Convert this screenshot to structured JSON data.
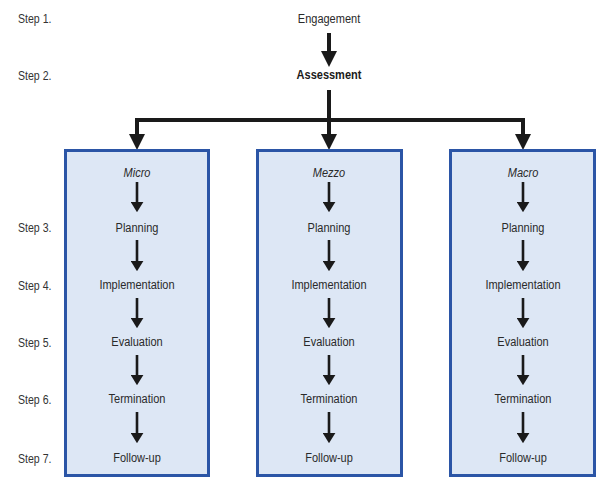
{
  "diagram": {
    "type": "flowchart",
    "colors": {
      "box_fill": "#dde7f5",
      "box_border": "#2b55a6",
      "arrow": "#1a1a1a",
      "text": "#2a2a2a"
    },
    "steps": [
      {
        "label": "Step 1.",
        "y": 20
      },
      {
        "label": "Step 2.",
        "y": 77
      },
      {
        "label": "Step 3.",
        "y": 229
      },
      {
        "label": "Step 4.",
        "y": 287
      },
      {
        "label": "Step 5.",
        "y": 344
      },
      {
        "label": "Step 6.",
        "y": 401
      },
      {
        "label": "Step 7.",
        "y": 460
      }
    ],
    "top_nodes": {
      "engagement": "Engagement",
      "assessment": "Assessment"
    },
    "columns": [
      {
        "title": "Micro",
        "stages": [
          "Planning",
          "Implementation",
          "Evaluation",
          "Termination",
          "Follow-up"
        ]
      },
      {
        "title": "Mezzo",
        "stages": [
          "Planning",
          "Implementation",
          "Evaluation",
          "Termination",
          "Follow-up"
        ]
      },
      {
        "title": "Macro",
        "stages": [
          "Planning",
          "Implementation",
          "Evaluation",
          "Termination",
          "Follow-up"
        ]
      }
    ]
  }
}
